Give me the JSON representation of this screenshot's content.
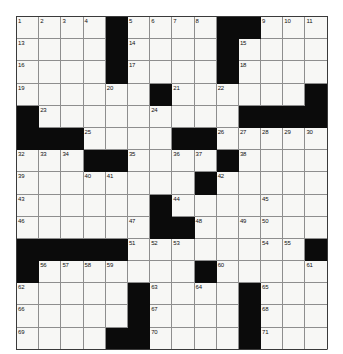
{
  "puzzle": {
    "title": "Crossword Grid",
    "columns": 14,
    "rows": 15,
    "cell_size": 22.2,
    "colors": {
      "white_cell": "#f7f7f5",
      "block_cell": "#0b0b0b",
      "grid_line": "#8e8e8e",
      "frame_line": "#3a3a3a",
      "number_text": "#111111",
      "page_background": "#ffffff"
    },
    "legend": {
      "white": "open letter square",
      "black": "blocked square"
    },
    "clue_numbers_max": 71,
    "grid_rows": [
      [
        "1",
        "2",
        "3",
        "4",
        "#",
        "5",
        "6",
        "7",
        "8",
        "#",
        "#",
        "9",
        "10",
        "11"
      ],
      [
        "13",
        "",
        "",
        "",
        "#",
        "14",
        "",
        "",
        "",
        "#",
        "15",
        "",
        "",
        "",
        ""
      ],
      [
        "16",
        "",
        "",
        "",
        "#",
        "17",
        "",
        "",
        "",
        "#",
        "18",
        "",
        "",
        ""
      ],
      [
        "19",
        "",
        "",
        "",
        "20",
        "",
        "#",
        "21",
        "",
        "22",
        "",
        "",
        "",
        "#"
      ],
      [
        "#",
        "23",
        "",
        "",
        "",
        "",
        "24",
        "",
        "",
        "",
        "#",
        "#",
        "#",
        "#"
      ],
      [
        "#",
        "#",
        "#",
        "25",
        "",
        "",
        "",
        "#",
        "#",
        "26",
        "27",
        "28",
        "29",
        "30"
      ],
      [
        "32",
        "33",
        "34",
        "#",
        "#",
        "35",
        "",
        "36",
        "37",
        "#",
        "38",
        "",
        "",
        ""
      ],
      [
        "39",
        "",
        "",
        "40",
        "41",
        "",
        "",
        "",
        "#",
        "42",
        "",
        "",
        "",
        ""
      ],
      [
        "43",
        "",
        "",
        "",
        "",
        "",
        "#",
        "44",
        "",
        "",
        "",
        "45",
        "",
        ""
      ],
      [
        "46",
        "",
        "",
        "",
        "",
        "47",
        "#",
        "#",
        "48",
        "",
        "49",
        "50",
        "",
        ""
      ],
      [
        "#",
        "#",
        "#",
        "#",
        "#",
        "51",
        "52",
        "53",
        "",
        "",
        "",
        "54",
        "55",
        "#"
      ],
      [
        "#",
        "56",
        "57",
        "58",
        "59",
        "",
        "",
        "",
        "#",
        "60",
        "",
        "",
        "",
        "61"
      ],
      [
        "62",
        "",
        "",
        "",
        "",
        "#",
        "63",
        "",
        "64",
        "",
        "#",
        "65",
        "",
        ""
      ],
      [
        "66",
        "",
        "",
        "",
        "",
        "#",
        "67",
        "",
        "",
        "",
        "#",
        "68",
        "",
        ""
      ],
      [
        "69",
        "",
        "",
        "",
        "#",
        "#",
        "70",
        "",
        "",
        "",
        "#",
        "71",
        "",
        ""
      ]
    ],
    "cells": [
      [
        {
          "t": "w",
          "n": "1"
        },
        {
          "t": "w",
          "n": "2"
        },
        {
          "t": "w",
          "n": "3"
        },
        {
          "t": "w",
          "n": "4"
        },
        {
          "t": "b",
          "n": ""
        },
        {
          "t": "w",
          "n": "5"
        },
        {
          "t": "w",
          "n": "6"
        },
        {
          "t": "w",
          "n": "7"
        },
        {
          "t": "w",
          "n": "8"
        },
        {
          "t": "b",
          "n": ""
        },
        {
          "t": "b",
          "n": ""
        },
        {
          "t": "w",
          "n": "9"
        },
        {
          "t": "w",
          "n": "10"
        },
        {
          "t": "w",
          "n": "11"
        }
      ],
      [
        {
          "t": "w",
          "n": "13"
        },
        {
          "t": "w",
          "n": ""
        },
        {
          "t": "w",
          "n": ""
        },
        {
          "t": "w",
          "n": ""
        },
        {
          "t": "b",
          "n": ""
        },
        {
          "t": "w",
          "n": "14"
        },
        {
          "t": "w",
          "n": ""
        },
        {
          "t": "w",
          "n": ""
        },
        {
          "t": "w",
          "n": ""
        },
        {
          "t": "b",
          "n": ""
        },
        {
          "t": "w",
          "n": "15"
        },
        {
          "t": "w",
          "n": ""
        },
        {
          "t": "w",
          "n": ""
        },
        {
          "t": "w",
          "n": ""
        }
      ],
      [
        {
          "t": "w",
          "n": "16"
        },
        {
          "t": "w",
          "n": ""
        },
        {
          "t": "w",
          "n": ""
        },
        {
          "t": "w",
          "n": ""
        },
        {
          "t": "b",
          "n": ""
        },
        {
          "t": "w",
          "n": "17"
        },
        {
          "t": "w",
          "n": ""
        },
        {
          "t": "w",
          "n": ""
        },
        {
          "t": "w",
          "n": ""
        },
        {
          "t": "b",
          "n": ""
        },
        {
          "t": "w",
          "n": "18"
        },
        {
          "t": "w",
          "n": ""
        },
        {
          "t": "w",
          "n": ""
        },
        {
          "t": "w",
          "n": ""
        }
      ],
      [
        {
          "t": "w",
          "n": "19"
        },
        {
          "t": "w",
          "n": ""
        },
        {
          "t": "w",
          "n": ""
        },
        {
          "t": "w",
          "n": ""
        },
        {
          "t": "w",
          "n": "20"
        },
        {
          "t": "w",
          "n": ""
        },
        {
          "t": "b",
          "n": ""
        },
        {
          "t": "w",
          "n": "21"
        },
        {
          "t": "w",
          "n": ""
        },
        {
          "t": "w",
          "n": "22"
        },
        {
          "t": "w",
          "n": ""
        },
        {
          "t": "w",
          "n": ""
        },
        {
          "t": "w",
          "n": ""
        },
        {
          "t": "b",
          "n": ""
        }
      ],
      [
        {
          "t": "b",
          "n": ""
        },
        {
          "t": "w",
          "n": "23"
        },
        {
          "t": "w",
          "n": ""
        },
        {
          "t": "w",
          "n": ""
        },
        {
          "t": "w",
          "n": ""
        },
        {
          "t": "w",
          "n": ""
        },
        {
          "t": "w",
          "n": "24"
        },
        {
          "t": "w",
          "n": ""
        },
        {
          "t": "w",
          "n": ""
        },
        {
          "t": "w",
          "n": ""
        },
        {
          "t": "b",
          "n": ""
        },
        {
          "t": "b",
          "n": ""
        },
        {
          "t": "b",
          "n": ""
        },
        {
          "t": "b",
          "n": ""
        }
      ],
      [
        {
          "t": "b",
          "n": ""
        },
        {
          "t": "b",
          "n": ""
        },
        {
          "t": "b",
          "n": ""
        },
        {
          "t": "w",
          "n": "25"
        },
        {
          "t": "w",
          "n": ""
        },
        {
          "t": "w",
          "n": ""
        },
        {
          "t": "w",
          "n": ""
        },
        {
          "t": "b",
          "n": ""
        },
        {
          "t": "b",
          "n": ""
        },
        {
          "t": "w",
          "n": "26"
        },
        {
          "t": "w",
          "n": "27"
        },
        {
          "t": "w",
          "n": "28"
        },
        {
          "t": "w",
          "n": "29"
        },
        {
          "t": "w",
          "n": "30"
        }
      ],
      [
        {
          "t": "w",
          "n": "32"
        },
        {
          "t": "w",
          "n": "33"
        },
        {
          "t": "w",
          "n": "34"
        },
        {
          "t": "b",
          "n": ""
        },
        {
          "t": "b",
          "n": ""
        },
        {
          "t": "w",
          "n": "35"
        },
        {
          "t": "w",
          "n": ""
        },
        {
          "t": "w",
          "n": "36"
        },
        {
          "t": "w",
          "n": "37"
        },
        {
          "t": "b",
          "n": ""
        },
        {
          "t": "w",
          "n": "38"
        },
        {
          "t": "w",
          "n": ""
        },
        {
          "t": "w",
          "n": ""
        },
        {
          "t": "w",
          "n": ""
        }
      ],
      [
        {
          "t": "w",
          "n": "39"
        },
        {
          "t": "w",
          "n": ""
        },
        {
          "t": "w",
          "n": ""
        },
        {
          "t": "w",
          "n": "40"
        },
        {
          "t": "w",
          "n": "41"
        },
        {
          "t": "w",
          "n": ""
        },
        {
          "t": "w",
          "n": ""
        },
        {
          "t": "w",
          "n": ""
        },
        {
          "t": "b",
          "n": ""
        },
        {
          "t": "w",
          "n": "42"
        },
        {
          "t": "w",
          "n": ""
        },
        {
          "t": "w",
          "n": ""
        },
        {
          "t": "w",
          "n": ""
        },
        {
          "t": "w",
          "n": ""
        }
      ],
      [
        {
          "t": "w",
          "n": "43"
        },
        {
          "t": "w",
          "n": ""
        },
        {
          "t": "w",
          "n": ""
        },
        {
          "t": "w",
          "n": ""
        },
        {
          "t": "w",
          "n": ""
        },
        {
          "t": "w",
          "n": ""
        },
        {
          "t": "b",
          "n": ""
        },
        {
          "t": "w",
          "n": "44"
        },
        {
          "t": "w",
          "n": ""
        },
        {
          "t": "w",
          "n": ""
        },
        {
          "t": "w",
          "n": ""
        },
        {
          "t": "w",
          "n": "45"
        },
        {
          "t": "w",
          "n": ""
        },
        {
          "t": "w",
          "n": ""
        }
      ],
      [
        {
          "t": "w",
          "n": "46"
        },
        {
          "t": "w",
          "n": ""
        },
        {
          "t": "w",
          "n": ""
        },
        {
          "t": "w",
          "n": ""
        },
        {
          "t": "w",
          "n": ""
        },
        {
          "t": "w",
          "n": "47"
        },
        {
          "t": "b",
          "n": ""
        },
        {
          "t": "b",
          "n": ""
        },
        {
          "t": "w",
          "n": "48"
        },
        {
          "t": "w",
          "n": ""
        },
        {
          "t": "w",
          "n": "49"
        },
        {
          "t": "w",
          "n": "50"
        },
        {
          "t": "w",
          "n": ""
        },
        {
          "t": "w",
          "n": ""
        }
      ],
      [
        {
          "t": "b",
          "n": ""
        },
        {
          "t": "b",
          "n": ""
        },
        {
          "t": "b",
          "n": ""
        },
        {
          "t": "b",
          "n": ""
        },
        {
          "t": "b",
          "n": ""
        },
        {
          "t": "w",
          "n": "51"
        },
        {
          "t": "w",
          "n": "52"
        },
        {
          "t": "w",
          "n": "53"
        },
        {
          "t": "w",
          "n": ""
        },
        {
          "t": "w",
          "n": ""
        },
        {
          "t": "w",
          "n": ""
        },
        {
          "t": "w",
          "n": "54"
        },
        {
          "t": "w",
          "n": "55"
        },
        {
          "t": "b",
          "n": ""
        }
      ],
      [
        {
          "t": "b",
          "n": ""
        },
        {
          "t": "w",
          "n": "56"
        },
        {
          "t": "w",
          "n": "57"
        },
        {
          "t": "w",
          "n": "58"
        },
        {
          "t": "w",
          "n": "59"
        },
        {
          "t": "w",
          "n": ""
        },
        {
          "t": "w",
          "n": ""
        },
        {
          "t": "w",
          "n": ""
        },
        {
          "t": "b",
          "n": ""
        },
        {
          "t": "w",
          "n": "60"
        },
        {
          "t": "w",
          "n": ""
        },
        {
          "t": "w",
          "n": ""
        },
        {
          "t": "w",
          "n": ""
        },
        {
          "t": "w",
          "n": "61"
        }
      ],
      [
        {
          "t": "w",
          "n": "62"
        },
        {
          "t": "w",
          "n": ""
        },
        {
          "t": "w",
          "n": ""
        },
        {
          "t": "w",
          "n": ""
        },
        {
          "t": "w",
          "n": ""
        },
        {
          "t": "b",
          "n": ""
        },
        {
          "t": "w",
          "n": "63"
        },
        {
          "t": "w",
          "n": ""
        },
        {
          "t": "w",
          "n": "64"
        },
        {
          "t": "w",
          "n": ""
        },
        {
          "t": "b",
          "n": ""
        },
        {
          "t": "w",
          "n": "65"
        },
        {
          "t": "w",
          "n": ""
        },
        {
          "t": "w",
          "n": ""
        }
      ],
      [
        {
          "t": "w",
          "n": "66"
        },
        {
          "t": "w",
          "n": ""
        },
        {
          "t": "w",
          "n": ""
        },
        {
          "t": "w",
          "n": ""
        },
        {
          "t": "w",
          "n": ""
        },
        {
          "t": "b",
          "n": ""
        },
        {
          "t": "w",
          "n": "67"
        },
        {
          "t": "w",
          "n": ""
        },
        {
          "t": "w",
          "n": ""
        },
        {
          "t": "w",
          "n": ""
        },
        {
          "t": "b",
          "n": ""
        },
        {
          "t": "w",
          "n": "68"
        },
        {
          "t": "w",
          "n": ""
        },
        {
          "t": "w",
          "n": ""
        }
      ],
      [
        {
          "t": "w",
          "n": "69"
        },
        {
          "t": "w",
          "n": ""
        },
        {
          "t": "w",
          "n": ""
        },
        {
          "t": "w",
          "n": ""
        },
        {
          "t": "b",
          "n": ""
        },
        {
          "t": "b",
          "n": ""
        },
        {
          "t": "w",
          "n": "70"
        },
        {
          "t": "w",
          "n": ""
        },
        {
          "t": "w",
          "n": ""
        },
        {
          "t": "w",
          "n": ""
        },
        {
          "t": "b",
          "n": ""
        },
        {
          "t": "w",
          "n": "71"
        },
        {
          "t": "w",
          "n": ""
        },
        {
          "t": "w",
          "n": ""
        }
      ]
    ]
  }
}
